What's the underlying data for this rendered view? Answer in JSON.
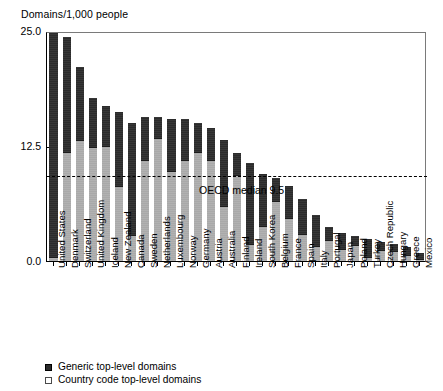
{
  "axis_title": "Domains/1,000 people",
  "median_label": "OECD median 9.5",
  "legend": {
    "generic": "Generic top-level domains",
    "country_code": "Country code top-level domains"
  },
  "colors": {
    "generic": "#2b2b2b",
    "country_code": "#a9a9a9",
    "axis": "#000000",
    "background": "#ffffff"
  },
  "chart_data": {
    "type": "bar",
    "stacked": true,
    "orientation": "vertical",
    "title": "",
    "subtitle": "",
    "xlabel": "",
    "ylabel": "Domains/1,000 people",
    "ylim": [
      0,
      25
    ],
    "yticks": [
      "0.0",
      "12.5",
      "25.0"
    ],
    "ytick_values": [
      0,
      12.5,
      25
    ],
    "grid": false,
    "legend_position": "below-left",
    "annotations": [
      {
        "type": "reference-line",
        "style": "dashed",
        "value": 9.5,
        "label": "OECD median 9.5"
      }
    ],
    "categories": [
      "United States",
      "Denmark",
      "Switzerland",
      "United Kingdom",
      "Iceland",
      "New Zealand",
      "Canada",
      "Sweden",
      "Netherlands",
      "Luxembourg",
      "Norway",
      "Germany",
      "Austria",
      "Australia",
      "Finland",
      "Ireland",
      "South Korea",
      "Belgium",
      "France",
      "Spain",
      "Italy",
      "Portugal",
      "Japan",
      "Poland",
      "Turkey",
      "Czech Republic",
      "Hungary",
      "Greece",
      "Mexico"
    ],
    "series": [
      {
        "name": "Country code top-level domains",
        "color": "#a9a9a9",
        "values": [
          0.4,
          11.9,
          13.1,
          12.4,
          12.5,
          8.2,
          2.8,
          11.0,
          13.4,
          9.8,
          11.0,
          11.9,
          11.0,
          6.0,
          9.4,
          1.8,
          3.8,
          6.5,
          4.7,
          2.9,
          1.6,
          2.3,
          1.3,
          1.7,
          0.4,
          1.2,
          1.1,
          0.7,
          0.2
        ]
      },
      {
        "name": "Generic top-level domains",
        "color": "#2b2b2b",
        "values": [
          24.4,
          12.4,
          8.0,
          5.3,
          4.3,
          8.0,
          12.2,
          4.7,
          2.3,
          5.6,
          4.4,
          3.1,
          3.5,
          7.2,
          2.3,
          8.9,
          5.7,
          2.5,
          3.5,
          3.8,
          3.4,
          1.4,
          1.8,
          1.0,
          2.0,
          0.9,
          0.8,
          0.8,
          0.7
        ]
      }
    ],
    "totals": [
      24.8,
      24.3,
      21.1,
      17.7,
      16.8,
      16.2,
      15.0,
      15.7,
      15.7,
      15.4,
      15.4,
      15.0,
      14.5,
      13.2,
      11.7,
      10.7,
      9.5,
      9.0,
      8.2,
      6.7,
      5.0,
      3.7,
      3.1,
      2.7,
      2.4,
      2.1,
      1.9,
      1.5,
      0.9
    ]
  }
}
